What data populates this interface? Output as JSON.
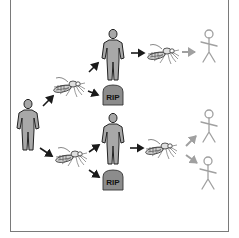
{
  "diagram": {
    "colors": {
      "frame": "#7a7a7a",
      "person_fill": "#a8a8a8",
      "person_stroke": "#222222",
      "arrow_dark": "#1a1a1a",
      "arrow_light": "#a0a0a0",
      "stick_figure": "#a0a0a0",
      "tombstone_fill": "#8c8c8c"
    },
    "nodes": [
      {
        "id": "source-person",
        "type": "infected-person"
      },
      {
        "id": "mosquito-upper",
        "type": "mosquito"
      },
      {
        "id": "mosquito-lower",
        "type": "mosquito"
      },
      {
        "id": "person-upper",
        "type": "infected-person"
      },
      {
        "id": "person-lower",
        "type": "infected-person"
      },
      {
        "id": "tombstone-upper",
        "type": "tombstone",
        "label": "RIP"
      },
      {
        "id": "tombstone-lower",
        "type": "tombstone",
        "label": "RIP"
      },
      {
        "id": "mosquito-right-upper",
        "type": "mosquito"
      },
      {
        "id": "mosquito-right-lower",
        "type": "mosquito"
      },
      {
        "id": "healthy-1",
        "type": "healthy-stick-figure"
      },
      {
        "id": "healthy-2",
        "type": "healthy-stick-figure"
      },
      {
        "id": "healthy-3",
        "type": "healthy-stick-figure"
      }
    ],
    "labels": {
      "tomb_upper": "RIP",
      "tomb_lower": "RIP"
    }
  }
}
